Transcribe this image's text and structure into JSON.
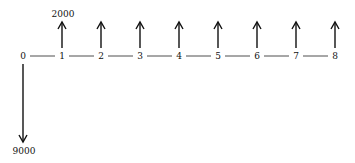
{
  "diagram": {
    "type": "cash-flow-diagram",
    "periods": [
      "0",
      "1",
      "2",
      "3",
      "4",
      "5",
      "6",
      "7",
      "8"
    ],
    "inflow": {
      "amount_label": "2000",
      "periods": [
        1,
        2,
        3,
        4,
        5,
        6,
        7,
        8
      ],
      "direction": "up"
    },
    "outflow": {
      "amount_label": "9000",
      "period": 0,
      "direction": "down"
    },
    "colors": {
      "line": "#222222",
      "arrow": "#111111",
      "text": "#111111"
    }
  }
}
